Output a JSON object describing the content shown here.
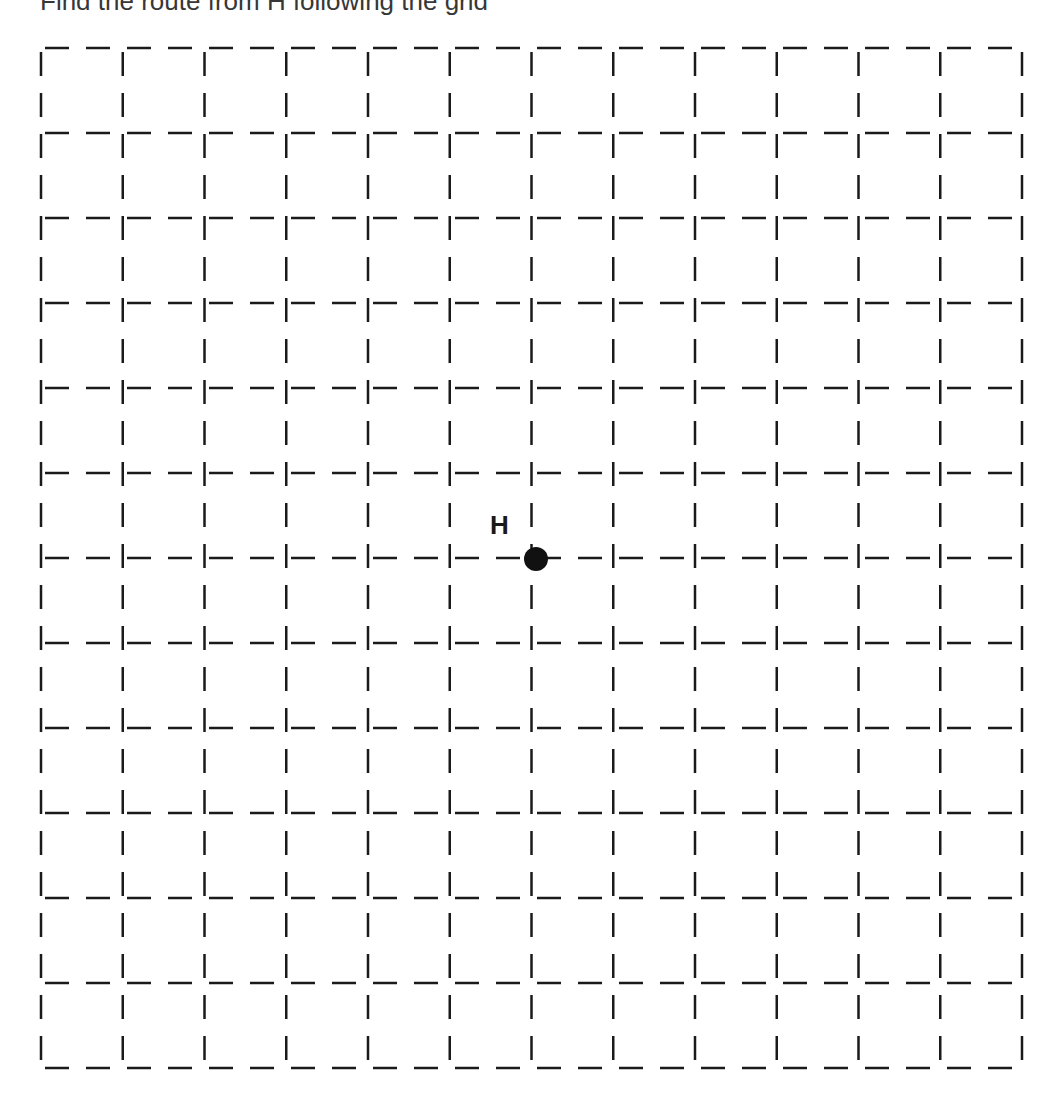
{
  "title_fragment": "Find the route from H following the grid",
  "grid": {
    "columns": 12,
    "rows": 12,
    "left": 41,
    "top": 48,
    "right": 1022,
    "bottom": 1068,
    "line_color": "#1a1a1a",
    "dash": "24 17"
  },
  "point": {
    "label": "H",
    "col": 6,
    "row": 6,
    "cx": 536,
    "cy": 559,
    "radius": 12,
    "color": "#111111"
  }
}
